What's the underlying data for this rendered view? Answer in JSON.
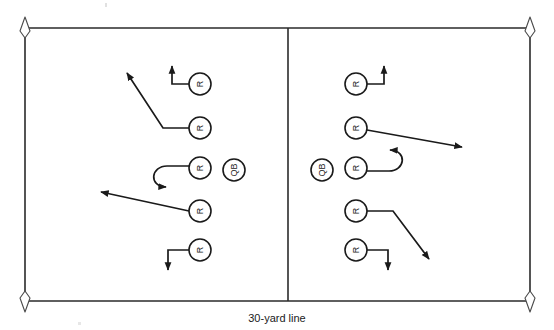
{
  "diagram": {
    "title_caption": "30-yard line",
    "field": {
      "left": 25,
      "top": 28,
      "right": 530,
      "bottom": 301,
      "divider_x": 288,
      "line_color": "#2b2b2b",
      "background_color": "#ffffff"
    },
    "pylons": [
      {
        "name": "pylon-top-left",
        "x": 25,
        "y": 28
      },
      {
        "name": "pylon-top-right",
        "x": 530,
        "y": 28
      },
      {
        "name": "pylon-bottom-left",
        "x": 25,
        "y": 301
      },
      {
        "name": "pylon-bottom-right",
        "x": 530,
        "y": 301
      }
    ],
    "players": [
      {
        "name": "player-left-r1",
        "label": "R",
        "x": 200,
        "y": 84,
        "r": 11,
        "side": "left"
      },
      {
        "name": "player-left-r2",
        "label": "R",
        "x": 200,
        "y": 128,
        "r": 11,
        "side": "left"
      },
      {
        "name": "player-left-r3",
        "label": "R",
        "x": 200,
        "y": 168,
        "r": 11,
        "side": "left"
      },
      {
        "name": "player-left-qb",
        "label": "QB",
        "x": 234,
        "y": 170,
        "r": 11,
        "side": "left"
      },
      {
        "name": "player-left-r4",
        "label": "R",
        "x": 200,
        "y": 211,
        "r": 11,
        "side": "left"
      },
      {
        "name": "player-left-r5",
        "label": "R",
        "x": 200,
        "y": 250,
        "r": 11,
        "side": "left"
      },
      {
        "name": "player-right-r1",
        "label": "R",
        "x": 356,
        "y": 84,
        "r": 11,
        "side": "right"
      },
      {
        "name": "player-right-r2",
        "label": "R",
        "x": 356,
        "y": 128,
        "r": 11,
        "side": "right"
      },
      {
        "name": "player-right-qb",
        "label": "QB",
        "x": 322,
        "y": 170,
        "r": 11,
        "side": "right"
      },
      {
        "name": "player-right-r3",
        "label": "R",
        "x": 356,
        "y": 168,
        "r": 11,
        "side": "right"
      },
      {
        "name": "player-right-r4",
        "label": "R",
        "x": 356,
        "y": 211,
        "r": 11,
        "side": "right"
      },
      {
        "name": "player-right-r5",
        "label": "R",
        "x": 356,
        "y": 250,
        "r": 11,
        "side": "right"
      }
    ],
    "routes": [
      {
        "name": "route-left-r1-go",
        "from": "player-left-r1",
        "type": "out-then-up",
        "path": "M189,84 L172,84 L172,62",
        "arrow": "up"
      },
      {
        "name": "route-left-r2-deep-out",
        "from": "player-left-r2",
        "type": "flat-then-diagonal",
        "path": "M189,128 L163,128 L124,70",
        "arrow": "upleft"
      },
      {
        "name": "route-left-r3-hook",
        "from": "player-left-r3",
        "type": "hook-curl",
        "path": "M189,166 L166,166 C152,166 150,186 170,187",
        "arrow": "right"
      },
      {
        "name": "route-left-r4-drag",
        "from": "player-left-r4",
        "type": "shallow-cross",
        "path": "M189,211 L97,191",
        "arrow": "left"
      },
      {
        "name": "route-left-r5-out-down",
        "from": "player-left-r5",
        "type": "in-then-down",
        "path": "M189,250 L168,250 L168,273",
        "arrow": "down"
      },
      {
        "name": "route-right-r1-go",
        "from": "player-right-r1",
        "type": "out-then-up",
        "path": "M367,84 L384,84 L384,62",
        "arrow": "up"
      },
      {
        "name": "route-right-r2-deep-out",
        "from": "player-right-r2",
        "type": "diagonal-out",
        "path": "M367,130 L466,148",
        "arrow": "right"
      },
      {
        "name": "route-right-r3-hook",
        "from": "player-right-r3",
        "type": "hook-curl",
        "path": "M367,171 L390,171 C404,171 406,151 386,150",
        "arrow": "left"
      },
      {
        "name": "route-right-r4-corner",
        "from": "player-right-r4",
        "type": "flat-then-diagonal",
        "path": "M367,211 L393,211 L432,263",
        "arrow": "downright"
      },
      {
        "name": "route-right-r5-out-down",
        "from": "player-right-r5",
        "type": "in-then-down",
        "path": "M367,250 L388,250 L388,273",
        "arrow": "down"
      }
    ]
  }
}
